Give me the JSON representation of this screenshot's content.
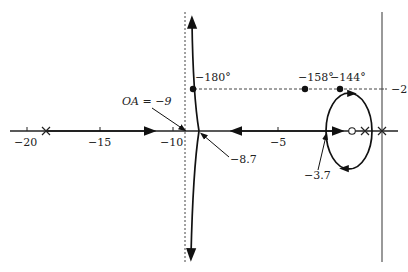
{
  "diagram": {
    "type": "root-locus",
    "real_axis_ticks": [
      {
        "label": "−20",
        "x": 27
      },
      {
        "label": "−15",
        "x": 100
      },
      {
        "label": "−10",
        "x": 173
      },
      {
        "label": "−5",
        "x": 278
      }
    ],
    "imag_axis_tick": {
      "label": "−2",
      "y": 89
    },
    "poles": [
      {
        "x": 46
      },
      {
        "x": 365
      },
      {
        "x": 382
      }
    ],
    "zeros": [
      {
        "x": 352
      }
    ],
    "annotations": {
      "oa": "OA = −9",
      "breakaway_left": "−8.7",
      "breakaway_right": "−3.7",
      "angle_180": "−180°",
      "angle_158": "−158°",
      "angle_144": "−144°"
    },
    "colors": {
      "locus": "#111111",
      "axis": "#333333",
      "dashed": "#444444",
      "text": "#222222"
    }
  }
}
